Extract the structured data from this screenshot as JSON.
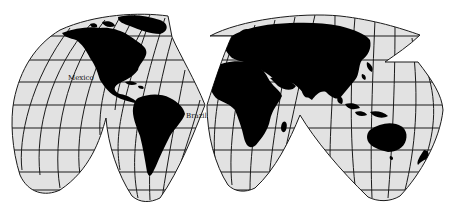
{
  "map": {
    "projection": "interrupted-homolosine",
    "colors": {
      "background": "#ffffff",
      "ocean": "#e2e2e2",
      "land": "#000000",
      "graticule": "#1a1a1a"
    },
    "labels": [
      {
        "id": "mexico",
        "text": "Mexico",
        "x": 72,
        "y": 80
      },
      {
        "id": "brazil",
        "text": "Brazil",
        "x": 188,
        "y": 118
      }
    ]
  }
}
